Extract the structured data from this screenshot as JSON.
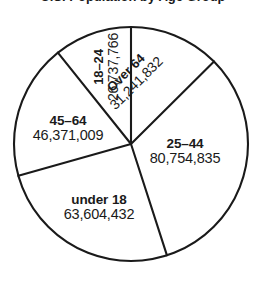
{
  "chart_data": {
    "type": "pie",
    "title": "U.S. Population by Age Group",
    "xlabel": "",
    "ylabel": "",
    "grid": false,
    "legend": "none",
    "label_style": "slice-labels",
    "total": 248709874,
    "start_angle_deg": 0,
    "direction": "clockwise",
    "categories": [
      "Over 64",
      "25–44",
      "under 18",
      "45–64",
      "18–24"
    ],
    "values": [
      31241832,
      80754835,
      63604432,
      46371009,
      26737766
    ],
    "value_labels": [
      "31,241,832",
      "80,754,835",
      "63,604,432",
      "46,371,009",
      "26,737,766"
    ],
    "slices": [
      {
        "name": "over-64",
        "label": "Over 64",
        "value": 31241832,
        "value_label": "31,241,832",
        "start_deg": 0,
        "sweep_deg": 45.2,
        "rotation_deg": -45
      },
      {
        "name": "25-44",
        "label": "25–44",
        "value": 80754835,
        "value_label": "80,754,835",
        "start_deg": 45.2,
        "sweep_deg": 116.9,
        "rotation_deg": 0
      },
      {
        "name": "under-18",
        "label": "under 18",
        "value": 63604432,
        "value_label": "63,604,432",
        "start_deg": 162.1,
        "sweep_deg": 92.1,
        "rotation_deg": 0
      },
      {
        "name": "45-64",
        "label": "45–64",
        "value": 46371009,
        "value_label": "46,371,009",
        "start_deg": 254.2,
        "sweep_deg": 67.1,
        "rotation_deg": 0
      },
      {
        "name": "18-24",
        "label": "18–24",
        "value": 26737766,
        "value_label": "26,737,766",
        "start_deg": 321.3,
        "sweep_deg": 38.7,
        "rotation_deg": -90
      }
    ],
    "colors": {
      "slice_fill": "#ffffff",
      "outline": "#1a1a1a",
      "text": "#1a1a1a",
      "background": "#ffffff"
    }
  }
}
